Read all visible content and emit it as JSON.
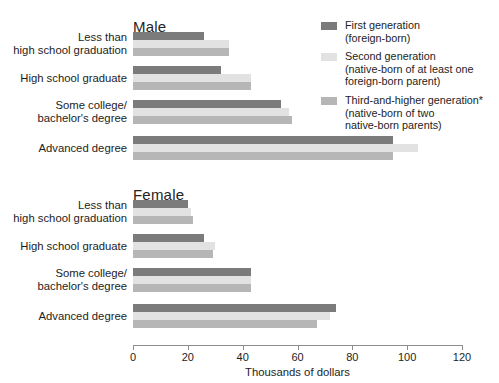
{
  "chart_data": {
    "type": "bar",
    "orientation": "horizontal",
    "title": "",
    "xlabel": "Thousands of dollars",
    "ylabel": "",
    "xlim": [
      0,
      120
    ],
    "xticks": [
      0,
      20,
      40,
      60,
      80,
      100,
      120
    ],
    "grid": false,
    "legend_position": "top-right",
    "categories": [
      "Less than\nhigh school graduation",
      "High school graduate",
      "Some college/\nbachelor's degree",
      "Advanced degree"
    ],
    "series": [
      {
        "name": "First generation\n(foreign-born)",
        "color": "#7b7b7b",
        "panels": {
          "Male": [
            26,
            32,
            54,
            95
          ],
          "Female": [
            20,
            26,
            43,
            74
          ]
        }
      },
      {
        "name": "Second generation\n(native-born of at least one\nforeign-born parent)",
        "color": "#e2e2e2",
        "panels": {
          "Male": [
            35,
            43,
            57,
            104
          ],
          "Female": [
            21,
            30,
            43,
            72
          ]
        }
      },
      {
        "name": "Third-and-higher generation*\n(native-born of two\nnative-born parents)",
        "color": "#b6b6b6",
        "panels": {
          "Male": [
            35,
            43,
            58,
            95
          ],
          "Female": [
            22,
            29,
            43,
            67
          ]
        }
      }
    ],
    "panels": [
      {
        "title": "Male",
        "values": [
          [
            26,
            35,
            35
          ],
          [
            32,
            43,
            43
          ],
          [
            54,
            57,
            58
          ],
          [
            95,
            104,
            95
          ]
        ]
      },
      {
        "title": "Female",
        "values": [
          [
            20,
            21,
            22
          ],
          [
            26,
            30,
            29
          ],
          [
            43,
            43,
            43
          ],
          [
            74,
            72,
            67
          ]
        ]
      }
    ]
  },
  "legend": {
    "items": [
      {
        "label": "First generation\n(foreign-born)",
        "color": "#7b7b7b"
      },
      {
        "label": "Second generation\n(native-born of at least one\nforeign-born parent)",
        "color": "#e2e2e2"
      },
      {
        "label": "Third-and-higher generation*\n(native-born of two\nnative-born parents)",
        "color": "#b6b6b6"
      }
    ]
  },
  "axis": {
    "tick_labels": [
      "0",
      "20",
      "40",
      "60",
      "80",
      "100",
      "120"
    ],
    "xlabel": "Thousands of dollars"
  },
  "panels": [
    {
      "title": "Male"
    },
    {
      "title": "Female"
    }
  ]
}
